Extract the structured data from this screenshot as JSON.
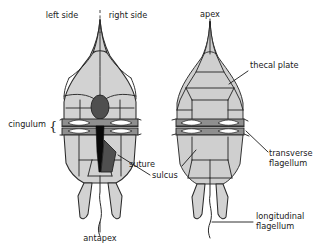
{
  "figure": {
    "background_color": "#ffffff",
    "plate_fill": "#d2d2d2",
    "outline_color": "#2a2a2a",
    "cingulum_color": "#8f8f8f",
    "sulcus_color": "#0a0a0a"
  },
  "labels": {
    "left_side": "left side",
    "right_side": "right side",
    "apex": "apex",
    "thecal_plate": "thecal plate",
    "cingulum": "cingulum",
    "sulcus": "sulcus",
    "suture": "suture",
    "antapex": "antapex",
    "transverse_flagellum_line1": "transverse",
    "transverse_flagellum_line2": "flagellum",
    "longitudinal_flagellum_line1": "longitudinal",
    "longitudinal_flagellum_line2": "flagellum",
    "brace": "{"
  },
  "views": {
    "left_view": "ventral view",
    "right_view": "dorsal view"
  }
}
